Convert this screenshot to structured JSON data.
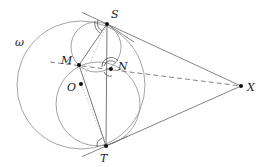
{
  "figure": {
    "type": "geometry-diagram",
    "labels": {
      "omega": "ω",
      "S": "S",
      "M": "M",
      "N": "N",
      "O": "O",
      "X": "X",
      "T": "T"
    },
    "points": {
      "S": [
        107,
        24
      ],
      "M": [
        79,
        65
      ],
      "N": [
        111,
        69
      ],
      "O": [
        81,
        84
      ],
      "X": [
        241,
        86
      ],
      "T": [
        106,
        146
      ]
    },
    "circles": [
      {
        "name": "omega",
        "center": [
          81,
          85
        ],
        "r": 64
      },
      {
        "name": "upper-circle",
        "center": [
          96,
          47
        ],
        "r": 25
      },
      {
        "name": "lower-circle",
        "center": [
          98,
          104
        ],
        "r": 42
      }
    ]
  }
}
